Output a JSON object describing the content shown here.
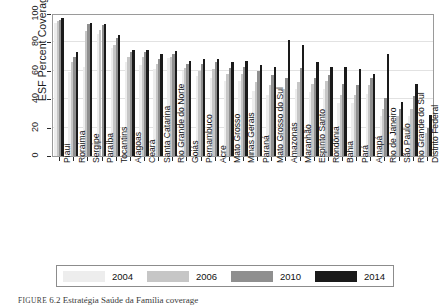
{
  "chart_data": {
    "type": "bar",
    "title": "",
    "xlabel": "",
    "ylabel": "ESF Percent Coverage",
    "ylim": [
      0,
      100
    ],
    "yticks": [
      0,
      20,
      40,
      60,
      80,
      100
    ],
    "grid": true,
    "legend_position": "bottom",
    "categories": [
      "Piauí",
      "Roraima",
      "Sergipe",
      "Paraíba",
      "Tocantins",
      "Alagoas",
      "Ceará",
      "Santa Catarina",
      "Rio Grande do Norte",
      "Goiás",
      "Pernambuco",
      "Acre",
      "Mato Grosso",
      "Minas Gerais",
      "Paraná",
      "Mato Grosso do Sul",
      "Amazonas",
      "Maranhão",
      "Espírito Santo",
      "Rondônia",
      "Bahia",
      "Pará",
      "Amapá",
      "Rio de Janeiro",
      "São Paulo",
      "Rio Grande do Sul",
      "Distrito Federal"
    ],
    "series": [
      {
        "name": "2004",
        "color": "#ededed",
        "values": [
          94,
          59,
          63,
          86,
          76,
          66,
          64,
          61,
          69,
          60,
          56,
          55,
          53,
          53,
          46,
          43,
          40,
          47,
          45,
          47,
          37,
          37,
          44,
          28,
          25,
          28,
          13
        ]
      },
      {
        "name": "2006",
        "color": "#c6c6c6",
        "values": [
          95,
          66,
          88,
          89,
          78,
          70,
          70,
          65,
          70,
          62,
          60,
          61,
          58,
          58,
          52,
          50,
          47,
          52,
          51,
          53,
          43,
          43,
          50,
          33,
          28,
          33,
          16
        ]
      },
      {
        "name": "2010",
        "color": "#8f8f8f",
        "values": [
          96,
          70,
          93,
          92,
          83,
          73,
          73,
          68,
          72,
          65,
          65,
          66,
          62,
          63,
          60,
          57,
          55,
          62,
          55,
          57,
          51,
          50,
          55,
          41,
          33,
          42,
          20
        ]
      },
      {
        "name": "2014",
        "color": "#1a1a1a",
        "values": [
          97,
          73,
          94,
          93,
          85,
          75,
          75,
          72,
          74,
          67,
          68,
          68,
          66,
          67,
          64,
          63,
          82,
          78,
          66,
          63,
          63,
          61,
          58,
          72,
          38,
          51,
          29
        ]
      }
    ]
  },
  "legend": {
    "items": [
      {
        "label": "2004"
      },
      {
        "label": "2006"
      },
      {
        "label": "2010"
      },
      {
        "label": "2014"
      }
    ]
  },
  "caption": {
    "prefix": "FIGURE",
    "number": "6.2",
    "text": "Estratégia Saúde da Família coverage"
  }
}
